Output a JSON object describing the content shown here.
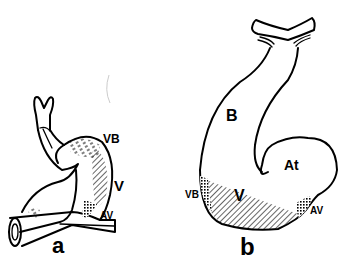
{
  "figure": {
    "panels": [
      {
        "id": "a",
        "caption": "a",
        "labels": {
          "vb": "VB",
          "v": "V",
          "av": "AV"
        }
      },
      {
        "id": "b",
        "caption": "b",
        "labels": {
          "b": "B",
          "at": "At",
          "vb": "VB",
          "v": "V",
          "av": "AV"
        }
      }
    ],
    "colors": {
      "ink": "#000000",
      "background": "#ffffff"
    }
  }
}
